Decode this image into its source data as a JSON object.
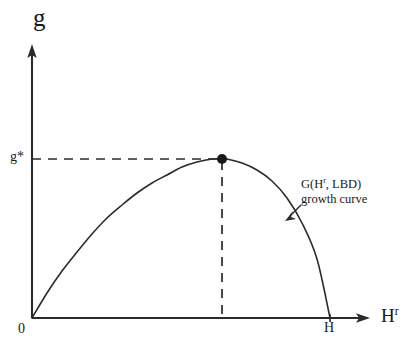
{
  "figure": {
    "width": 420,
    "height": 355,
    "background_color": "#ffffff",
    "stroke_color": "#2b2b2b",
    "text_color": "#1a1a1a"
  },
  "axes": {
    "y_axis_title": "g",
    "x_axis_title_base": "H",
    "x_axis_title_sup": "r",
    "origin_label": "0",
    "y_marker_label": "g*",
    "x_marker_label": "H"
  },
  "annotation": {
    "line1_prefix": "G(H",
    "line1_sup": "r",
    "line1_suffix": ", LBD)",
    "line2": "growth curve"
  },
  "chart_data": {
    "type": "line",
    "title": "",
    "xlabel": "H^r",
    "ylabel": "g",
    "grid": false,
    "legend": "none",
    "xlim": [
      0,
      1.13
    ],
    "ylim": [
      0,
      1.17
    ],
    "axis_pixel_origin": [
      32,
      318
    ],
    "axis_pixel_x_end": 368,
    "axis_pixel_y_end": 46,
    "annotations": [
      {
        "text": "G(H^r, LBD) growth curve",
        "pointer_from": [
          292,
          200
        ],
        "pointer_to": [
          287,
          218
        ]
      }
    ],
    "markers": [
      {
        "name": "peak",
        "x": 0.633,
        "y": 1.0,
        "pixel": [
          222,
          159
        ],
        "style": "filled-circle",
        "radius": 5,
        "x_guide": "dashed",
        "y_guide": "dashed",
        "y_tick_label": "g*",
        "x_tick_label": ""
      }
    ],
    "x_ticks": [
      {
        "label": "0",
        "x": 0.0,
        "pixel_x": 32
      },
      {
        "label": "H",
        "x": 1.0,
        "pixel_x": 330
      }
    ],
    "y_ticks": [
      {
        "label": "g*",
        "y": 1.0,
        "pixel_y": 159
      }
    ],
    "series": [
      {
        "name": "G(H^r, LBD) growth curve",
        "color": "#2b2b2b",
        "style": "solid",
        "x": [
          0.0,
          0.05,
          0.1,
          0.15,
          0.2,
          0.25,
          0.3,
          0.35,
          0.4,
          0.45,
          0.5,
          0.55,
          0.6,
          0.633,
          0.65,
          0.7,
          0.75,
          0.8,
          0.85,
          0.9,
          0.95,
          1.0
        ],
        "y": [
          0.0,
          0.155,
          0.3,
          0.42,
          0.535,
          0.635,
          0.72,
          0.795,
          0.86,
          0.91,
          0.95,
          0.98,
          0.998,
          1.0,
          0.998,
          0.975,
          0.93,
          0.86,
          0.755,
          0.6,
          0.37,
          0.0
        ],
        "pixel_points": [
          [
            32,
            318
          ],
          [
            47,
            293
          ],
          [
            62,
            271
          ],
          [
            77,
            252
          ],
          [
            92,
            234
          ],
          [
            107,
            218
          ],
          [
            122,
            205
          ],
          [
            137,
            193
          ],
          [
            152,
            183
          ],
          [
            167,
            175
          ],
          [
            182,
            167
          ],
          [
            197,
            162
          ],
          [
            212,
            159
          ],
          [
            222,
            159
          ],
          [
            227,
            159
          ],
          [
            242,
            163
          ],
          [
            257,
            170
          ],
          [
            272,
            181
          ],
          [
            287,
            198
          ],
          [
            302,
            223
          ],
          [
            317,
            259
          ],
          [
            330,
            318
          ]
        ]
      }
    ]
  }
}
